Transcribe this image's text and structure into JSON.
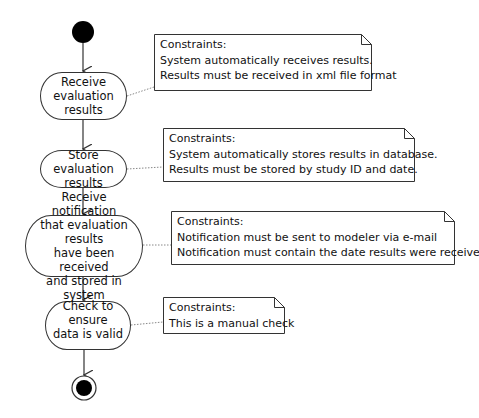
{
  "diagram": {
    "type": "UML activity diagram",
    "nodes": {
      "initial": {
        "label": "initial-node"
      },
      "final": {
        "label": "final-node"
      }
    },
    "actions": [
      {
        "id": "a1",
        "label": "Receive\nevaluation\nresults"
      },
      {
        "id": "a2",
        "label": "Store evaluation\nresults"
      },
      {
        "id": "a3",
        "label": "Receive notification\nthat evaluation results\nhave been received\nand stored in system"
      },
      {
        "id": "a4",
        "label": "Check to ensure\ndata is valid"
      }
    ],
    "notes": [
      {
        "for": "a1",
        "lines": [
          "Constraints:",
          "System automatically receives results.",
          "Results must be received in xml file format"
        ]
      },
      {
        "for": "a2",
        "lines": [
          "Constraints:",
          "System automatically stores results in database.",
          "Results must be stored by study ID and date."
        ]
      },
      {
        "for": "a3",
        "lines": [
          "Constraints:",
          "Notification must be sent to modeler via e-mail",
          "Notification must contain the date results were received"
        ]
      },
      {
        "for": "a4",
        "lines": [
          "Constraints:",
          "This is a manual check"
        ]
      }
    ]
  }
}
